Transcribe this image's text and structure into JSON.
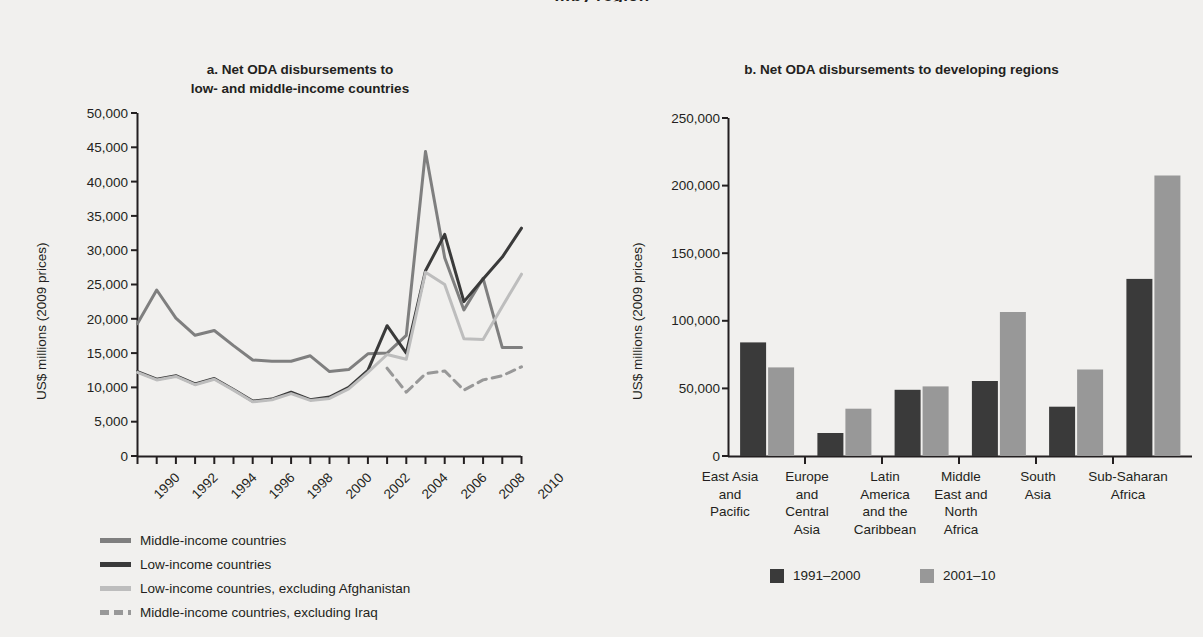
{
  "clipped_header": "…by region",
  "panel_a": {
    "title_line1": "a.  Net ODA disbursements to",
    "title_line2": "low- and middle-income countries",
    "ylabel": "US$ millions (2009 prices)",
    "yticks": [
      "50,000",
      "45,000",
      "40,000",
      "35,000",
      "30,000",
      "25,000",
      "20,000",
      "15,000",
      "10,000",
      "5,000",
      "0"
    ],
    "xticks": [
      "1990",
      "1992",
      "1994",
      "1996",
      "1998",
      "2000",
      "2002",
      "2004",
      "2006",
      "2008",
      "2010"
    ],
    "legend": [
      {
        "label": "Middle-income countries",
        "style": "solid",
        "color": "#7f7f7f"
      },
      {
        "label": "Low-income countries",
        "style": "solid",
        "color": "#3a3a3a"
      },
      {
        "label": "Low-income countries, excluding Afghanistan",
        "style": "solid",
        "color": "#bdbdbd"
      },
      {
        "label": "Middle-income countries, excluding Iraq",
        "style": "dashed",
        "color": "#989898"
      }
    ]
  },
  "panel_b": {
    "title": "b.  Net ODA disbursements to developing regions",
    "ylabel": "US$ millions (2009 prices)",
    "yticks": [
      "250,000",
      "200,000",
      "150,000",
      "100,000",
      "50,000",
      "0"
    ],
    "legend": [
      {
        "label": "1991–2000",
        "color": "#3a3a3a"
      },
      {
        "label": "2001–10",
        "color": "#989898"
      }
    ]
  },
  "chart_data": [
    {
      "type": "line",
      "title": "a. Net ODA disbursements to low- and middle-income countries",
      "xlabel": "",
      "ylabel": "US$ millions (2009 prices)",
      "ylim": [
        0,
        50000
      ],
      "ytick_step": 5000,
      "grid": false,
      "legend_position": "below-left",
      "x": [
        1990,
        1991,
        1992,
        1993,
        1994,
        1995,
        1996,
        1997,
        1998,
        1999,
        2000,
        2001,
        2002,
        2003,
        2004,
        2005,
        2006,
        2007,
        2008,
        2009,
        2010
      ],
      "series": [
        {
          "name": "Middle-income countries",
          "color": "#7f7f7f",
          "style": "solid",
          "values": [
            19300,
            24200,
            20100,
            17600,
            18300,
            16100,
            14000,
            13800,
            13800,
            14600,
            12300,
            12600,
            14900,
            15000,
            17600,
            44400,
            28900,
            21300,
            25900,
            15800,
            15800
          ]
        },
        {
          "name": "Low-income countries",
          "color": "#3a3a3a",
          "style": "solid",
          "values": [
            12300,
            11200,
            11700,
            10500,
            11300,
            9700,
            8000,
            8300,
            9300,
            8200,
            8600,
            10000,
            12500,
            19000,
            15000,
            27000,
            32300,
            22500,
            25800,
            29000,
            33200
          ]
        },
        {
          "name": "Low-income countries, excluding Afghanistan",
          "color": "#bdbdbd",
          "style": "solid",
          "values": [
            12200,
            11100,
            11600,
            10400,
            11200,
            9600,
            7900,
            8200,
            9100,
            8100,
            8400,
            9800,
            12200,
            14800,
            14100,
            26800,
            25000,
            17100,
            17000,
            21800,
            26500
          ]
        },
        {
          "name": "Middle-income countries, excluding Iraq",
          "color": "#989898",
          "style": "dashed",
          "values": [
            null,
            null,
            null,
            null,
            null,
            null,
            null,
            null,
            null,
            null,
            null,
            null,
            null,
            12800,
            9300,
            12000,
            12400,
            9600,
            11100,
            11700,
            13000
          ]
        }
      ]
    },
    {
      "type": "bar",
      "title": "b. Net ODA disbursements to developing regions",
      "xlabel": "",
      "ylabel": "US$ millions (2009 prices)",
      "ylim": [
        0,
        250000
      ],
      "ytick_step": 50000,
      "grid": false,
      "legend_position": "below-center",
      "categories": [
        "East Asia and Pacific",
        "Europe and Central Asia",
        "Latin America and the Caribbean",
        "Middle East and North Africa",
        "South Asia",
        "Sub-Saharan Africa"
      ],
      "category_lines": [
        [
          "East Asia",
          "and",
          "Pacific"
        ],
        [
          "Europe",
          "and",
          "Central",
          "Asia"
        ],
        [
          "Latin",
          "America",
          "and the",
          "Caribbean"
        ],
        [
          "Middle",
          "East and",
          "North",
          "Africa"
        ],
        [
          "South",
          "Asia"
        ],
        [
          "Sub-Saharan",
          "Africa"
        ]
      ],
      "series": [
        {
          "name": "1991–2000",
          "color": "#3a3a3a",
          "values": [
            84000,
            17000,
            49000,
            55500,
            36500,
            131000
          ]
        },
        {
          "name": "2001–10",
          "color": "#989898",
          "values": [
            65500,
            35000,
            51500,
            106500,
            64000,
            207500
          ]
        }
      ]
    }
  ]
}
